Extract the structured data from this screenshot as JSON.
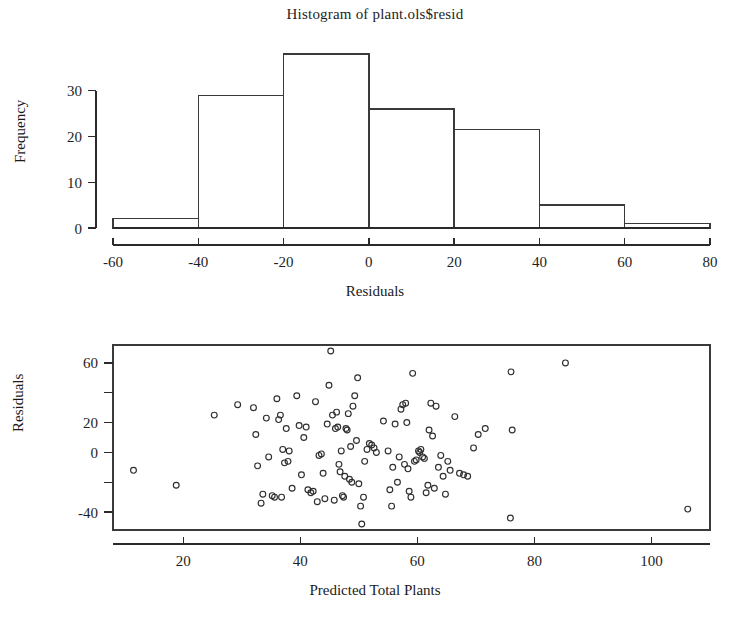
{
  "figure": {
    "panels": [
      "histogram-of-residuals",
      "residuals-vs-predicted-scatter"
    ]
  },
  "histogram": {
    "title": "Histogram of plant.ols$resid",
    "xlabel": "Residuals",
    "ylabel": "Frequency",
    "xticks": [
      "-60",
      "-40",
      "-20",
      "0",
      "20",
      "40",
      "60",
      "80"
    ],
    "yticks": [
      "0",
      "10",
      "20",
      "30"
    ]
  },
  "scatter": {
    "xlabel": "Predicted Total Plants",
    "ylabel": "Residuals",
    "xticks": [
      "20",
      "40",
      "60",
      "80",
      "100"
    ],
    "yticks": [
      "-40",
      "0",
      "20",
      "60"
    ]
  },
  "chart_data": [
    {
      "type": "bar",
      "title": "Histogram of plant.ols$resid",
      "xlabel": "Residuals",
      "ylabel": "Frequency",
      "bin_edges": [
        -60,
        -40,
        -20,
        0,
        20,
        40,
        60,
        80
      ],
      "categories": [
        "-60 to -40",
        "-40 to -20",
        "-20 to 0",
        "0 to 20",
        "20 to 40",
        "40 to 60",
        "60 to 80"
      ],
      "values": [
        2,
        29,
        38,
        26,
        21.5,
        5,
        1
      ],
      "xlim": [
        -60,
        80
      ],
      "ylim": [
        0,
        38
      ],
      "xtick_values": [
        -60,
        -40,
        -20,
        0,
        20,
        40,
        60,
        80
      ],
      "ytick_values": [
        0,
        10,
        20,
        30
      ],
      "grid": false,
      "legend": "none"
    },
    {
      "type": "scatter",
      "title": "",
      "xlabel": "Predicted Total Plants",
      "ylabel": "Residuals",
      "xlim": [
        8,
        110
      ],
      "ylim": [
        -52,
        72
      ],
      "xtick_values": [
        20,
        40,
        60,
        80,
        100
      ],
      "ytick_values": [
        -40,
        -20,
        0,
        20,
        40,
        60
      ],
      "ytick_labels_shown": [
        -40,
        0,
        20,
        60
      ],
      "grid": false,
      "legend": "none",
      "marker": "open-circle",
      "points": [
        [
          11.5,
          -12
        ],
        [
          18.8,
          -22
        ],
        [
          25.3,
          25
        ],
        [
          29.3,
          32
        ],
        [
          32.0,
          30
        ],
        [
          32.4,
          12
        ],
        [
          32.7,
          -9
        ],
        [
          33.3,
          -34
        ],
        [
          33.6,
          -28
        ],
        [
          34.2,
          23
        ],
        [
          34.6,
          -3
        ],
        [
          35.2,
          -29
        ],
        [
          35.6,
          -30
        ],
        [
          36.0,
          36
        ],
        [
          36.3,
          22
        ],
        [
          36.6,
          25
        ],
        [
          36.8,
          -30
        ],
        [
          37.0,
          2
        ],
        [
          37.3,
          -7
        ],
        [
          37.6,
          16
        ],
        [
          37.9,
          -6
        ],
        [
          38.1,
          1
        ],
        [
          38.6,
          -24
        ],
        [
          39.4,
          38
        ],
        [
          39.8,
          18
        ],
        [
          40.2,
          -15
        ],
        [
          40.6,
          10
        ],
        [
          41.0,
          17
        ],
        [
          41.3,
          -25
        ],
        [
          41.8,
          -27
        ],
        [
          42.2,
          -26
        ],
        [
          42.6,
          34
        ],
        [
          42.9,
          -33
        ],
        [
          43.2,
          -2
        ],
        [
          43.6,
          -1
        ],
        [
          43.9,
          -14
        ],
        [
          44.2,
          -31
        ],
        [
          44.6,
          19
        ],
        [
          44.9,
          45
        ],
        [
          45.2,
          68
        ],
        [
          45.5,
          25
        ],
        [
          45.8,
          -32
        ],
        [
          46.0,
          16
        ],
        [
          46.2,
          27
        ],
        [
          46.4,
          17
        ],
        [
          46.6,
          -8
        ],
        [
          46.8,
          -13
        ],
        [
          47.0,
          1
        ],
        [
          47.2,
          -29
        ],
        [
          47.4,
          -30
        ],
        [
          47.6,
          -16
        ],
        [
          47.8,
          16
        ],
        [
          48.0,
          15
        ],
        [
          48.2,
          26
        ],
        [
          48.4,
          -18
        ],
        [
          48.6,
          4
        ],
        [
          48.8,
          -20
        ],
        [
          49.0,
          31
        ],
        [
          49.3,
          38
        ],
        [
          49.6,
          8
        ],
        [
          49.8,
          50
        ],
        [
          50.0,
          -21
        ],
        [
          50.3,
          -36
        ],
        [
          50.5,
          -48
        ],
        [
          50.8,
          -30
        ],
        [
          51.0,
          -6
        ],
        [
          51.4,
          2
        ],
        [
          51.8,
          6
        ],
        [
          52.2,
          5
        ],
        [
          52.6,
          3
        ],
        [
          53.0,
          0
        ],
        [
          54.2,
          21
        ],
        [
          55.0,
          1
        ],
        [
          55.3,
          -25
        ],
        [
          55.6,
          -36
        ],
        [
          55.8,
          -10
        ],
        [
          56.2,
          19
        ],
        [
          56.6,
          -20
        ],
        [
          56.9,
          -3
        ],
        [
          57.2,
          29
        ],
        [
          57.5,
          32
        ],
        [
          57.8,
          -8
        ],
        [
          58.0,
          33
        ],
        [
          58.2,
          20
        ],
        [
          58.4,
          -11
        ],
        [
          58.6,
          -26
        ],
        [
          58.9,
          -30
        ],
        [
          59.2,
          53
        ],
        [
          59.5,
          -6
        ],
        [
          59.8,
          -5
        ],
        [
          60.2,
          1
        ],
        [
          60.4,
          0
        ],
        [
          60.6,
          2
        ],
        [
          60.9,
          -3
        ],
        [
          61.2,
          -4
        ],
        [
          61.5,
          -27
        ],
        [
          61.8,
          -22
        ],
        [
          62.0,
          15
        ],
        [
          62.3,
          33
        ],
        [
          62.6,
          11
        ],
        [
          62.9,
          -24
        ],
        [
          63.2,
          31
        ],
        [
          63.6,
          -10
        ],
        [
          64.0,
          -2
        ],
        [
          64.4,
          -16
        ],
        [
          64.8,
          -28
        ],
        [
          65.2,
          -6
        ],
        [
          65.6,
          -12
        ],
        [
          66.4,
          24
        ],
        [
          67.2,
          -14
        ],
        [
          67.9,
          -15
        ],
        [
          68.6,
          -16
        ],
        [
          69.6,
          3
        ],
        [
          70.4,
          12
        ],
        [
          71.6,
          16
        ],
        [
          75.9,
          -44
        ],
        [
          76.0,
          54
        ],
        [
          76.2,
          15
        ],
        [
          85.3,
          60
        ],
        [
          106.2,
          -38
        ]
      ],
      "n_points": 118
    }
  ]
}
